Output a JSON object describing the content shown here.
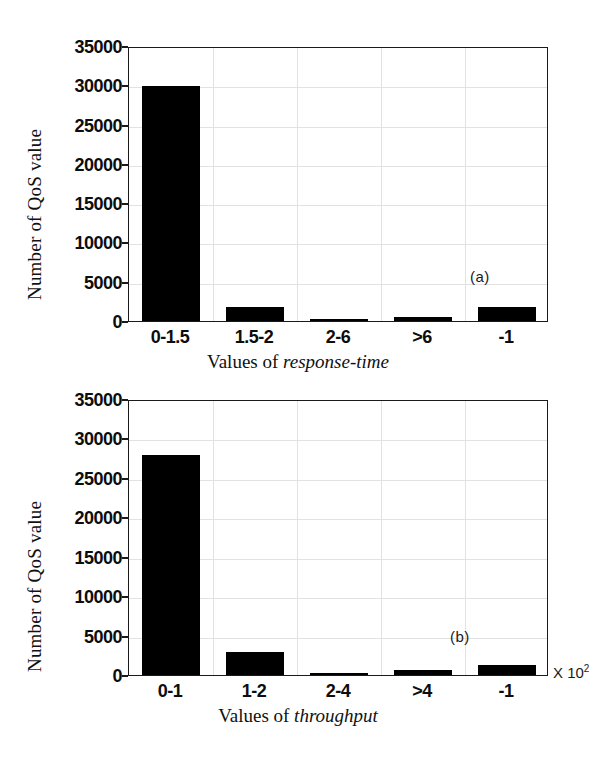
{
  "figure": {
    "background_color": "#ffffff",
    "bar_color": "#000000",
    "axis_color": "#1a1a1a",
    "grid_color": "#e2e2e2"
  },
  "chart_data": [
    {
      "type": "bar",
      "panel": "(a)",
      "title": "",
      "categories": [
        "0-1.5",
        "1.5-2",
        "2-6",
        ">6",
        "-1"
      ],
      "values": [
        29900,
        1800,
        250,
        520,
        1800
      ],
      "xlabel_prefix": "Values of ",
      "xlabel_emphasis": "response-time",
      "ylabel": "Number of QoS value",
      "yticks": [
        0,
        5000,
        10000,
        15000,
        20000,
        25000,
        30000,
        35000
      ],
      "ytick_labels": [
        "0",
        "5000",
        "10000",
        "15000",
        "20000",
        "25000",
        "30000",
        "35000"
      ],
      "ylim": [
        0,
        35000
      ],
      "grid": true,
      "legend": "none",
      "unit_note": ""
    },
    {
      "type": "bar",
      "panel": "(b)",
      "title": "",
      "categories": [
        "0-1",
        "1-2",
        "2-4",
        ">4",
        "-1"
      ],
      "values": [
        27900,
        2900,
        250,
        630,
        1270
      ],
      "xlabel_prefix": "Values of ",
      "xlabel_emphasis": "throughput",
      "ylabel": "Number of QoS value",
      "yticks": [
        0,
        5000,
        10000,
        15000,
        20000,
        25000,
        30000,
        35000
      ],
      "ytick_labels": [
        "0",
        "5000",
        "10000",
        "15000",
        "20000",
        "25000",
        "30000",
        "35000"
      ],
      "ylim": [
        0,
        35000
      ],
      "grid": true,
      "legend": "none",
      "unit_note_prefix": "X 10",
      "unit_note_exponent": "2"
    }
  ]
}
